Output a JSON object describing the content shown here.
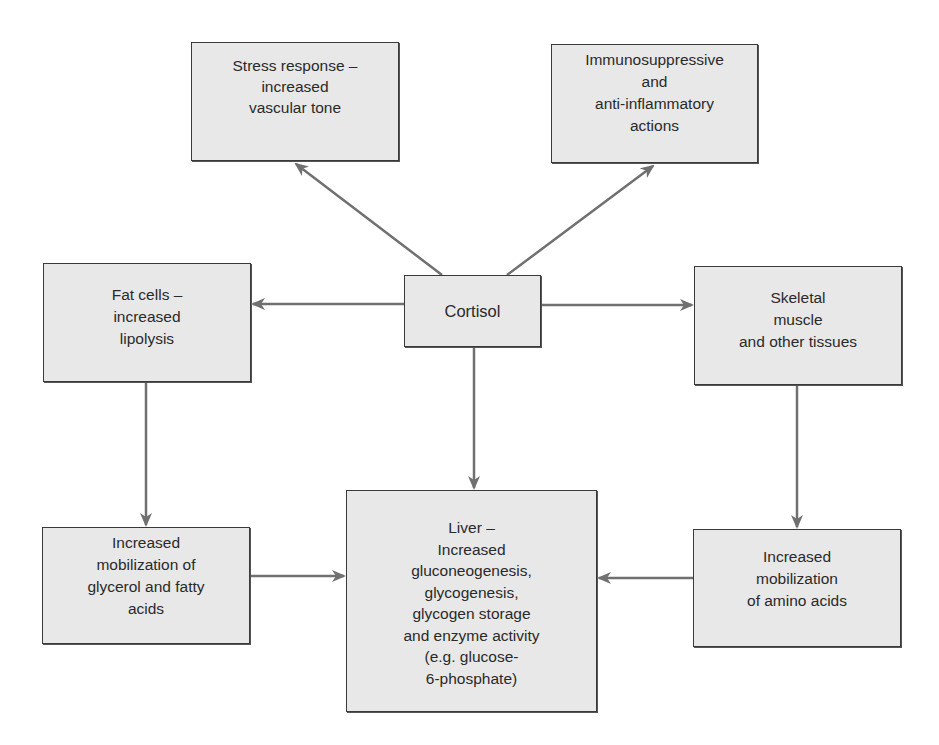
{
  "diagram": {
    "colors": {
      "box_fill": "#e8e8e8",
      "box_border": "#3a3a3a",
      "arrow": "#707070",
      "text": "#2a2a2a"
    },
    "nodes": {
      "cortisol": {
        "label": "Cortisol"
      },
      "stress": {
        "label": "Stress response –\nincreased\nvascular tone"
      },
      "immuno": {
        "label": "Immunosuppressive\nand\nanti-inflammatory\nactions"
      },
      "fat": {
        "label": "Fat cells –\nincreased\nlipolysis"
      },
      "skeletal": {
        "label": "Skeletal\nmuscle\nand other tissues"
      },
      "glycerol": {
        "label": "Increased\nmobilization of\nglycerol and fatty\nacids"
      },
      "liver": {
        "label": "Liver –\nIncreased\ngluconeogenesis,\nglycogenesis,\nglycogen storage\nand enzyme activity\n(e.g. glucose-\n6-phosphate)"
      },
      "amino": {
        "label": "Increased\nmobilization\nof amino acids"
      }
    },
    "edges": [
      {
        "from": "cortisol",
        "to": "stress"
      },
      {
        "from": "cortisol",
        "to": "immuno"
      },
      {
        "from": "cortisol",
        "to": "fat"
      },
      {
        "from": "cortisol",
        "to": "skeletal"
      },
      {
        "from": "cortisol",
        "to": "liver"
      },
      {
        "from": "fat",
        "to": "glycerol"
      },
      {
        "from": "skeletal",
        "to": "amino"
      },
      {
        "from": "glycerol",
        "to": "liver"
      },
      {
        "from": "amino",
        "to": "liver"
      }
    ]
  }
}
